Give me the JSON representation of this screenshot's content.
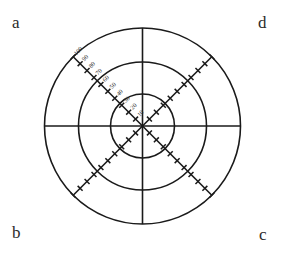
{
  "figure": {
    "background_color": "#ffffff",
    "stroke_color": "#1a1a1a",
    "label_color": "#2b2b2b"
  },
  "corner_labels": {
    "top_left": "a",
    "top_right": "d",
    "bottom_left": "b",
    "bottom_right": "c"
  },
  "chart_data": {
    "type": "line",
    "title": "",
    "xlabel": "",
    "ylabel": "",
    "grid": true,
    "legend_position": "none",
    "center": {
      "x": 142.5,
      "y": 126
    },
    "rings": [
      {
        "label": "inner",
        "radius_px": 32,
        "value": 33
      },
      {
        "label": "middle",
        "radius_px": 64,
        "value": 66
      },
      {
        "label": "outer",
        "radius_px": 98,
        "value": 100
      }
    ],
    "axes": [
      {
        "name": "horizontal-axis",
        "angle_deg": 0,
        "style": "plain"
      },
      {
        "name": "vertical-axis",
        "angle_deg": 90,
        "style": "plain"
      },
      {
        "name": "diagonal-axis-nw-se",
        "angle_deg": 135,
        "style": "tick-hatched"
      },
      {
        "name": "diagonal-axis-ne-sw",
        "angle_deg": 45,
        "style": "tick-hatched"
      }
    ],
    "radial_scale": {
      "axis": "upper-left diagonal",
      "ticks": [
        10,
        20,
        30,
        40,
        50,
        60,
        70,
        80,
        90,
        100
      ],
      "ylim": [
        0,
        100
      ],
      "tick_step": 10
    },
    "tick_marks": {
      "style": "perpendicular cross-stroke",
      "spacing_value": 10,
      "length_px": 7,
      "count_per_diagonal_arm": 10
    }
  }
}
